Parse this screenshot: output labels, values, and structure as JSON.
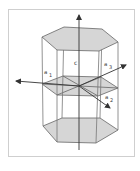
{
  "diagram": {
    "labels": {
      "c": "c",
      "a1_left": "a",
      "a1_left_sub": "1",
      "a3": "a",
      "a3_sub": "3",
      "a2": "a",
      "a2_sub": "2"
    },
    "colors": {
      "face_fill": "#d6d6d6",
      "edge": "#666666",
      "axis": "#333333",
      "frame": "#cfcfcf"
    }
  }
}
